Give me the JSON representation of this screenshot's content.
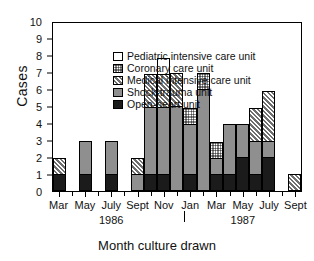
{
  "chart_data": {
    "type": "bar",
    "title": "",
    "xlabel": "Month culture drawn",
    "ylabel": "Cases",
    "ylim": [
      0,
      10
    ],
    "yticks": [
      0,
      1,
      2,
      3,
      4,
      5,
      6,
      7,
      8,
      9,
      10
    ],
    "stacked": true,
    "grid": false,
    "legend_position": "upper-left",
    "legend": [
      "Pediatric intensive care unit",
      "Coronary care unit",
      "Medical intensive care unit",
      "Shock-trauma unit",
      "Open-heart unit"
    ],
    "year_labels": [
      {
        "text": "1986",
        "at_category": 4
      },
      {
        "text": "1987",
        "at_category": 14
      }
    ],
    "year_divider_after_category": 9,
    "categories": [
      "Mar",
      "",
      "May",
      "",
      "July",
      "",
      "Sept",
      "",
      "Nov",
      "",
      "Jan",
      "",
      "Mar",
      "",
      "May",
      "",
      "July",
      "",
      "Sept"
    ],
    "tick_labels": [
      "Mar",
      "May",
      "July",
      "Sept",
      "Nov",
      "Jan",
      "Mar",
      "May",
      "July",
      "Sept"
    ],
    "series": [
      {
        "name": "Open-heart unit",
        "pattern": "solid-black",
        "values": [
          1,
          0,
          1,
          0,
          1,
          0,
          0,
          1,
          1,
          0,
          1,
          0,
          1,
          1,
          2,
          1,
          2,
          0,
          0
        ]
      },
      {
        "name": "Shock-trauma unit",
        "pattern": "solid-gray",
        "values": [
          0,
          0,
          2,
          0,
          2,
          0,
          1,
          4,
          4,
          5,
          3,
          6,
          1,
          3,
          2,
          2,
          1,
          0,
          0
        ]
      },
      {
        "name": "Medical intensive care unit",
        "pattern": "diagonal-hatch",
        "values": [
          1,
          0,
          0,
          0,
          0,
          0,
          1,
          2,
          2,
          2,
          0,
          0,
          0,
          0,
          0,
          2,
          3,
          0,
          1
        ]
      },
      {
        "name": "Coronary care unit",
        "pattern": "cross-hatch",
        "values": [
          0,
          0,
          0,
          0,
          0,
          0,
          0,
          0,
          0,
          0,
          1,
          1,
          1,
          0,
          0,
          0,
          0,
          0,
          0
        ]
      },
      {
        "name": "Pediatric intensive care unit",
        "pattern": "white-open",
        "values": [
          0,
          0,
          0,
          0,
          0,
          0,
          0,
          0,
          1,
          0,
          0,
          0,
          0,
          0,
          0,
          0,
          0,
          0,
          0
        ]
      }
    ],
    "totals": [
      2,
      0,
      3,
      0,
      3,
      0,
      2,
      7,
      8,
      7,
      5,
      7,
      3,
      4,
      4,
      5,
      6,
      0,
      1
    ]
  }
}
